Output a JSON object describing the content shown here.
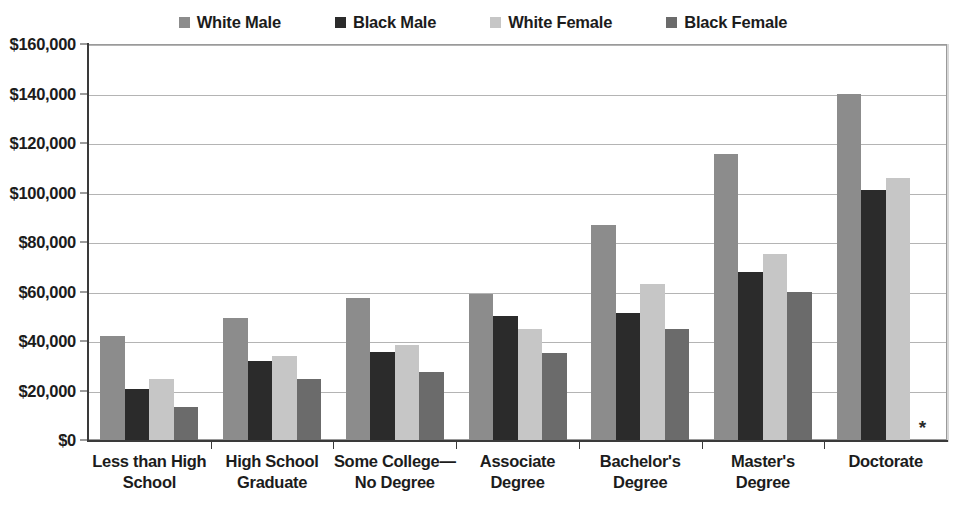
{
  "chart_data": {
    "type": "bar",
    "title": "",
    "xlabel": "",
    "ylabel": "",
    "ylim": [
      0,
      160000
    ],
    "ytick_step": 20000,
    "grid": true,
    "legend_position": "top-center",
    "value_prefix": "$",
    "categories": [
      "Less than High School",
      "High School Graduate",
      "Some College—No Degree",
      "Associate Degree",
      "Bachelor's Degree",
      "Master's Degree",
      "Doctorate"
    ],
    "category_lines": [
      [
        "Less than High",
        "School"
      ],
      [
        "High School",
        "Graduate"
      ],
      [
        "Some College—",
        "No Degree"
      ],
      [
        "Associate",
        "Degree"
      ],
      [
        "Bachelor's",
        "Degree"
      ],
      [
        "Master's",
        "Degree"
      ],
      [
        "Doctorate"
      ]
    ],
    "series": [
      {
        "name": "White Male",
        "color": "#8c8c8c",
        "values": [
          42000,
          49500,
          57500,
          59000,
          87000,
          115500,
          140000
        ]
      },
      {
        "name": "Black Male",
        "color": "#2b2b2b",
        "values": [
          20500,
          32000,
          35500,
          50000,
          51500,
          68000,
          101000
        ]
      },
      {
        "name": "White Female",
        "color": "#c6c6c6",
        "values": [
          24500,
          34000,
          38500,
          45000,
          63000,
          75000,
          106000
        ]
      },
      {
        "name": "Black Female",
        "color": "#6b6b6b",
        "values": [
          13500,
          24500,
          27500,
          35000,
          45000,
          60000,
          null
        ]
      }
    ],
    "ytick_labels": [
      "$0",
      "$20,000",
      "$40,000",
      "$60,000",
      "$80,000",
      "$100,000",
      "$120,000",
      "$140,000",
      "$160,000"
    ],
    "ytick_values": [
      0,
      20000,
      40000,
      60000,
      80000,
      100000,
      120000,
      140000,
      160000
    ],
    "annotations": [
      {
        "name": "missing-data-asterisk",
        "text": "*",
        "category": "Doctorate",
        "series": "Black Female",
        "meaning": "no data available"
      }
    ]
  },
  "legend": {
    "items": [
      {
        "label": "White Male",
        "color": "#8c8c8c"
      },
      {
        "label": "Black Male",
        "color": "#2b2b2b"
      },
      {
        "label": "White Female",
        "color": "#c6c6c6"
      },
      {
        "label": "Black Female",
        "color": "#6b6b6b"
      }
    ]
  }
}
